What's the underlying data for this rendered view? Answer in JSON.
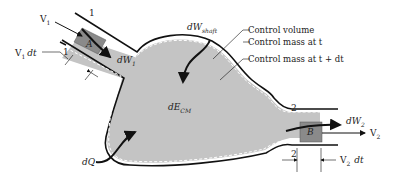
{
  "diagram": {
    "type": "thermodynamic control volume",
    "colors": {
      "fill": "#c4c4c4",
      "mass_block": "#8a8a8a",
      "outline": "#111111",
      "dashed": "#ffffff",
      "text": "#222222"
    },
    "labels": {
      "v1": "V",
      "v1_sub": "1",
      "v1dt": "V",
      "v1dt_sub": "1",
      "v1dt_suffix": "dt",
      "section1_top": "1",
      "section1_bottom": "1",
      "block_a": "A",
      "dw1": "dW",
      "dw1_sub": "1",
      "dw_shaft": "dW",
      "dw_shaft_sub": "shaft",
      "de_cm": "dE",
      "de_cm_sub": "CM",
      "dq": "dQ",
      "section2_top": "2",
      "section2_bottom": "2",
      "block_b": "B",
      "dw2": "dW",
      "dw2_sub": "2",
      "v2": "V",
      "v2_sub": "2",
      "v2dt": "V",
      "v2dt_sub": "2",
      "v2dt_suffix": "dt"
    },
    "legend": [
      {
        "label": "Control volume"
      },
      {
        "label": "Control mass at t"
      },
      {
        "label": "Control mass at t + dt"
      }
    ]
  }
}
